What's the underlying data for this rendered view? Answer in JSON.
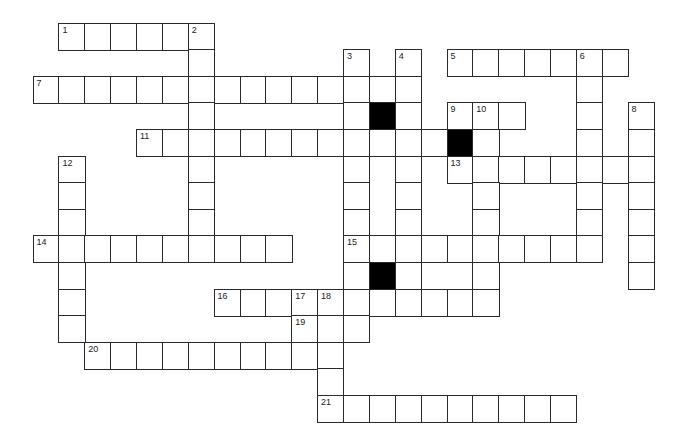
{
  "puzzle": {
    "type": "crossword",
    "rows": 15,
    "cols": 24,
    "geometry": {
      "x0": 33.3,
      "y0": 23.3,
      "cell_w": 25.87,
      "cell_h": 26.6
    },
    "colors": {
      "border": "#2a2a2a",
      "cell": "#ffffff",
      "block": "#000000"
    },
    "rows_cells": [
      [
        1,
        2,
        3,
        4,
        5,
        6
      ],
      [
        6,
        12,
        14,
        16,
        17,
        18,
        19,
        20,
        21,
        22
      ],
      [
        0,
        1,
        2,
        3,
        4,
        5,
        6,
        7,
        8,
        9,
        10,
        11,
        12,
        13,
        14,
        21
      ],
      [
        6,
        12,
        13,
        14,
        16,
        17,
        18,
        21,
        23
      ],
      [
        4,
        5,
        6,
        7,
        8,
        9,
        10,
        11,
        12,
        13,
        14,
        15,
        16,
        17,
        21,
        23
      ],
      [
        1,
        6,
        12,
        14,
        16,
        17,
        18,
        19,
        20,
        21,
        22,
        23
      ],
      [
        1,
        6,
        12,
        14,
        17,
        21,
        23
      ],
      [
        1,
        6,
        12,
        14,
        17,
        21,
        23
      ],
      [
        0,
        1,
        2,
        3,
        4,
        5,
        6,
        7,
        8,
        9,
        12,
        13,
        14,
        15,
        16,
        17,
        18,
        19,
        20,
        21,
        23
      ],
      [
        1,
        12,
        13,
        14,
        17,
        23
      ],
      [
        1,
        7,
        8,
        9,
        10,
        11,
        12,
        13,
        14,
        15,
        16,
        17
      ],
      [
        1,
        10,
        11,
        12
      ],
      [
        2,
        3,
        4,
        5,
        6,
        7,
        8,
        9,
        10,
        11
      ],
      [
        11
      ],
      [
        11,
        12,
        13,
        14,
        15,
        16,
        17,
        18,
        19,
        20
      ]
    ],
    "blocks": [
      [
        3,
        13
      ],
      [
        4,
        16
      ],
      [
        9,
        13
      ]
    ],
    "numbers": [
      {
        "n": "1",
        "r": 0,
        "c": 1
      },
      {
        "n": "2",
        "r": 0,
        "c": 6
      },
      {
        "n": "3",
        "r": 1,
        "c": 12
      },
      {
        "n": "4",
        "r": 1,
        "c": 14
      },
      {
        "n": "5",
        "r": 1,
        "c": 16
      },
      {
        "n": "6",
        "r": 1,
        "c": 21
      },
      {
        "n": "7",
        "r": 2,
        "c": 0
      },
      {
        "n": "8",
        "r": 3,
        "c": 23
      },
      {
        "n": "9",
        "r": 3,
        "c": 16
      },
      {
        "n": "10",
        "r": 3,
        "c": 17
      },
      {
        "n": "11",
        "r": 4,
        "c": 4
      },
      {
        "n": "12",
        "r": 5,
        "c": 1
      },
      {
        "n": "13",
        "r": 5,
        "c": 16
      },
      {
        "n": "14",
        "r": 8,
        "c": 0
      },
      {
        "n": "15",
        "r": 8,
        "c": 12
      },
      {
        "n": "16",
        "r": 10,
        "c": 7
      },
      {
        "n": "17",
        "r": 10,
        "c": 10
      },
      {
        "n": "18",
        "r": 10,
        "c": 11
      },
      {
        "n": "19",
        "r": 11,
        "c": 10
      },
      {
        "n": "20",
        "r": 12,
        "c": 2
      },
      {
        "n": "21",
        "r": 14,
        "c": 11
      }
    ]
  }
}
